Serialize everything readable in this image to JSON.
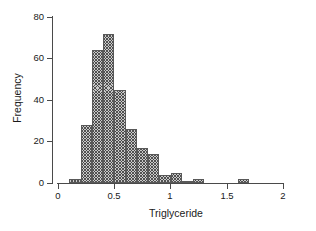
{
  "chart_data": {
    "type": "bar",
    "title": "",
    "subtitle": "",
    "xlabel": "Triglyceride",
    "ylabel": "Frequency",
    "xlim": [
      0,
      2
    ],
    "ylim": [
      0,
      80
    ],
    "xticks": [
      "0",
      "0.5",
      "1",
      "1.5",
      "2"
    ],
    "xtick_values": [
      0,
      0.5,
      1,
      1.5,
      2
    ],
    "yticks": [
      "0",
      "20",
      "40",
      "60",
      "80"
    ],
    "ytick_values": [
      0,
      20,
      40,
      60,
      80
    ],
    "grid": false,
    "legend": "none",
    "bin_width": 0.1,
    "bin_starts": [
      0.1,
      0.2,
      0.3,
      0.4,
      0.5,
      0.6,
      0.7,
      0.8,
      0.9,
      1.0,
      1.1,
      1.2,
      1.3,
      1.4,
      1.5,
      1.6
    ],
    "categories": [
      "0.1-0.2",
      "0.2-0.3",
      "0.3-0.4",
      "0.4-0.5",
      "0.5-0.6",
      "0.6-0.7",
      "0.7-0.8",
      "0.8-0.9",
      "0.9-1.0",
      "1.0-1.1",
      "1.1-1.2",
      "1.2-1.3",
      "1.3-1.4",
      "1.4-1.5",
      "1.5-1.6",
      "1.6-1.7"
    ],
    "values": [
      2,
      28,
      64,
      72,
      45,
      26,
      17,
      14,
      4,
      5,
      1,
      2,
      0,
      0,
      0,
      2
    ],
    "bar_fill": "#c9c9c9",
    "bar_edge": "#595959",
    "bar_pattern": "crosshatch",
    "axis_color": "#4a4a4a"
  }
}
